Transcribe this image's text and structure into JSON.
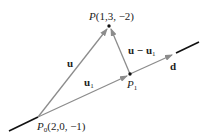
{
  "diagram": {
    "points": {
      "P": {
        "label": "P(1,3, −2)",
        "name": "P",
        "coords": "(1,3, −2)"
      },
      "P0": {
        "label_main": "P",
        "label_sub": "0",
        "coords": "(2,0, −1)"
      },
      "P1": {
        "label_main": "P",
        "label_sub": "1"
      }
    },
    "vectors": {
      "u": {
        "label": "u"
      },
      "u1": {
        "label_main": "u",
        "label_sub": "1"
      },
      "u_minus_u1": {
        "label_main": "u − u",
        "label_sub": "1"
      },
      "d": {
        "label": "d"
      }
    },
    "colors": {
      "vector_arrow": "#8c8c8c",
      "line": "#111111",
      "point": "#111111",
      "text": "#222222"
    }
  }
}
